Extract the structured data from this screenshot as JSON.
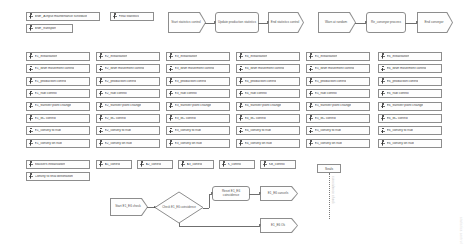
{
  "canvas": {
    "width": 467,
    "height": 250,
    "background": "#ffffff",
    "line_color": "#8d8d8d",
    "text_color": "#4a4a4a"
  },
  "top_left_nodes": [
    {
      "label": "BNE_A input maintenance schedule",
      "x": 26,
      "y": 12,
      "w": 74,
      "h": 9
    },
    {
      "label": "Final statistics",
      "x": 110,
      "y": 12,
      "w": 44,
      "h": 9
    },
    {
      "label": "BNE_transport",
      "x": 26,
      "y": 24,
      "w": 47,
      "h": 9
    }
  ],
  "top_flow_left": {
    "nodes": [
      {
        "id": "start",
        "shape": "pentagon",
        "label": "Start statistics control",
        "x": 168,
        "y": 12,
        "w": 38,
        "h": 21
      },
      {
        "id": "update",
        "shape": "rounded",
        "label": "Update production statistics",
        "x": 215,
        "y": 12,
        "w": 44,
        "h": 21
      },
      {
        "id": "end",
        "shape": "pentagon",
        "label": "End statistics control",
        "x": 268,
        "y": 12,
        "w": 36,
        "h": 21
      }
    ],
    "connectors": [
      {
        "from": "start",
        "to": "update"
      },
      {
        "from": "update",
        "to": "end"
      }
    ]
  },
  "top_flow_right": {
    "nodes": [
      {
        "id": "warn",
        "shape": "pentagon",
        "label": "Warn at random",
        "x": 318,
        "y": 12,
        "w": 38,
        "h": 21
      },
      {
        "id": "reopen",
        "shape": "rounded",
        "label": "Re_conveyor process",
        "x": 366,
        "y": 12,
        "w": 40,
        "h": 21
      },
      {
        "id": "endconv",
        "shape": "pentagon",
        "label": "End conveyor",
        "x": 417,
        "y": 12,
        "w": 36,
        "h": 21
      }
    ],
    "connectors": [
      {
        "from": "warn",
        "to": "reopen"
      },
      {
        "from": "reopen",
        "to": "endconv"
      }
    ]
  },
  "equipment_columns": [
    {
      "name": "E1",
      "x": 26,
      "items": [
        "E1_initialisation",
        "E1_BNE movement control",
        "E1_production control",
        "E1_hub control",
        "E1_transfer point change",
        "E1_BC control",
        "E1_convey to hub",
        "E1_convey on hub"
      ]
    },
    {
      "name": "E2",
      "x": 96,
      "items": [
        "E2_initialisation",
        "E2_BNE movement control",
        "E2_production control",
        "E2_hub control",
        "E2_transfer point change",
        "E2_BC control",
        "E2_convey to hub",
        "E2_convey on hub"
      ]
    },
    {
      "name": "E3",
      "x": 166,
      "items": [
        "E3_initialisation",
        "E3_BNE movement control",
        "E3_production control",
        "E3_hub control",
        "E3_transfer point change",
        "E3_BC control",
        "E3_convey to hub",
        "E3_convey on hub"
      ]
    },
    {
      "name": "E4",
      "x": 236,
      "items": [
        "E4_initialisation",
        "E4_BNE movement control",
        "E4_production control",
        "E4_hub control",
        "E4_transfer point change",
        "E4_BC control",
        "E4_convey to hub",
        "E4_convey on hub"
      ]
    },
    {
      "name": "E5",
      "x": 306,
      "items": [
        "E5_initialisation",
        "E5_BNE movement control",
        "E5_production control",
        "E5_hub control",
        "E5_transfer point change",
        "E5_BC control",
        "E5_convey to hub",
        "E5_convey on hub"
      ]
    },
    {
      "name": "E6",
      "x": 378,
      "items": [
        "E6_initialisation",
        "E6_BNE movement control",
        "E6_production control",
        "E6_hub control",
        "E6_transfer point change",
        "E6_BC control",
        "E6_convey to hub",
        "E6_convey on hub"
      ]
    }
  ],
  "equipment_layout": {
    "first_row_y": 52,
    "row_step": 12.4,
    "box_w": 64,
    "box_h": 9
  },
  "stacker_row": {
    "y": 160,
    "h": 9,
    "nodes": [
      {
        "label": "Stackers initialisation",
        "x": 26,
        "w": 64
      },
      {
        "label": "A1_control",
        "x": 96,
        "w": 36
      },
      {
        "label": "A2_control",
        "x": 137,
        "w": 36
      },
      {
        "label": "A3_control",
        "x": 178,
        "w": 36
      },
      {
        "label": "K_control",
        "x": 219,
        "w": 36
      },
      {
        "label": "KB_control",
        "x": 260,
        "w": 36
      }
    ]
  },
  "stacker_row2": {
    "y": 172,
    "h": 9,
    "nodes": [
      {
        "label": "Convey to final destination",
        "x": 26,
        "w": 64
      }
    ]
  },
  "bottom_flow": {
    "nodes": [
      {
        "id": "start",
        "shape": "pentagon",
        "label": "Start E1_E6 check",
        "x": 110,
        "y": 198,
        "w": 38,
        "h": 18
      },
      {
        "id": "check",
        "shape": "diamond",
        "label": "Check E1_E6 coincidence",
        "x": 155,
        "y": 192,
        "w": 48,
        "h": 31
      },
      {
        "id": "reset",
        "shape": "rounded",
        "label": "Reset E1_E6 coincidence",
        "x": 212,
        "y": 186,
        "w": 38,
        "h": 15
      },
      {
        "id": "cancels",
        "shape": "pentagon",
        "label": "E1_E6 cancels",
        "x": 260,
        "y": 186,
        "w": 38,
        "h": 15
      },
      {
        "id": "ok",
        "shape": "pentagon",
        "label": "E1_E6 Ok",
        "x": 260,
        "y": 218,
        "w": 38,
        "h": 15
      }
    ],
    "connectors": [
      {
        "from": "start",
        "to": "check"
      },
      {
        "from": "check",
        "to": "reset"
      },
      {
        "from": "reset",
        "to": "cancels"
      },
      {
        "from": "check",
        "to": "ok"
      }
    ]
  },
  "seals_note": {
    "label": "Seals",
    "x": 317,
    "y": 164,
    "w": 24,
    "h": 9,
    "annotation": "coincidence check"
  },
  "watermark": {
    "text": "statistics control"
  },
  "ghost_labels": {
    "left": "",
    "right": ""
  }
}
